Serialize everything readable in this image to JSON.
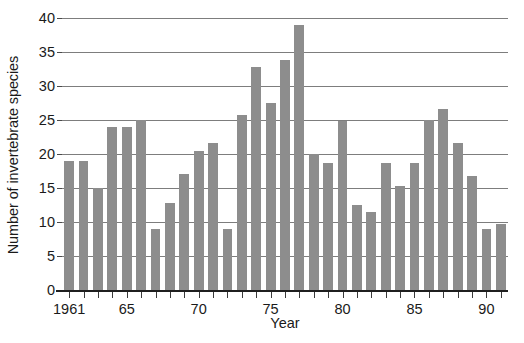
{
  "chart_data": {
    "type": "bar",
    "title": "",
    "xlabel": "Year",
    "ylabel": "Number of invertebrate species",
    "categories": [
      1961,
      1962,
      1963,
      1964,
      1965,
      1966,
      1967,
      1968,
      1969,
      1970,
      1971,
      1972,
      1973,
      1974,
      1975,
      1976,
      1977,
      1978,
      1979,
      1980,
      1981,
      1982,
      1983,
      1984,
      1985,
      1986,
      1987,
      1988,
      1989,
      1990,
      1991
    ],
    "values": [
      19,
      19,
      15,
      24,
      24,
      25,
      9,
      12.8,
      17,
      20.5,
      21.6,
      9,
      25.8,
      32.8,
      27.5,
      33.8,
      39,
      20,
      18.7,
      24.8,
      12.5,
      11.5,
      18.7,
      15.3,
      18.7,
      25,
      26.6,
      21.6,
      16.7,
      9,
      9.7
    ],
    "ylim": [
      0,
      40
    ],
    "ytick_values": [
      0,
      5,
      10,
      15,
      20,
      25,
      30,
      35,
      40
    ],
    "ytick_labels": [
      "0",
      "5",
      "10",
      "15",
      "20",
      "25",
      "30",
      "35",
      "40"
    ],
    "xtick_values": [
      1961,
      1965,
      1970,
      1975,
      1980,
      1985,
      1990
    ],
    "xtick_labels": [
      "1961",
      "65",
      "70",
      "75",
      "80",
      "85",
      "90"
    ],
    "xtick_minor_values": [
      1962,
      1963,
      1964,
      1966,
      1967,
      1968,
      1969,
      1971,
      1972,
      1973,
      1974,
      1976,
      1977,
      1978,
      1979,
      1981,
      1982,
      1983,
      1984,
      1986,
      1987,
      1988,
      1989,
      1991
    ],
    "grid": true,
    "grid_axis": "y",
    "legend": "none",
    "bar_color": "#8d8d8d",
    "axis_color": "#1f1f1f",
    "grid_color": "#7d7d7d",
    "bar_width_fraction": 0.68
  }
}
